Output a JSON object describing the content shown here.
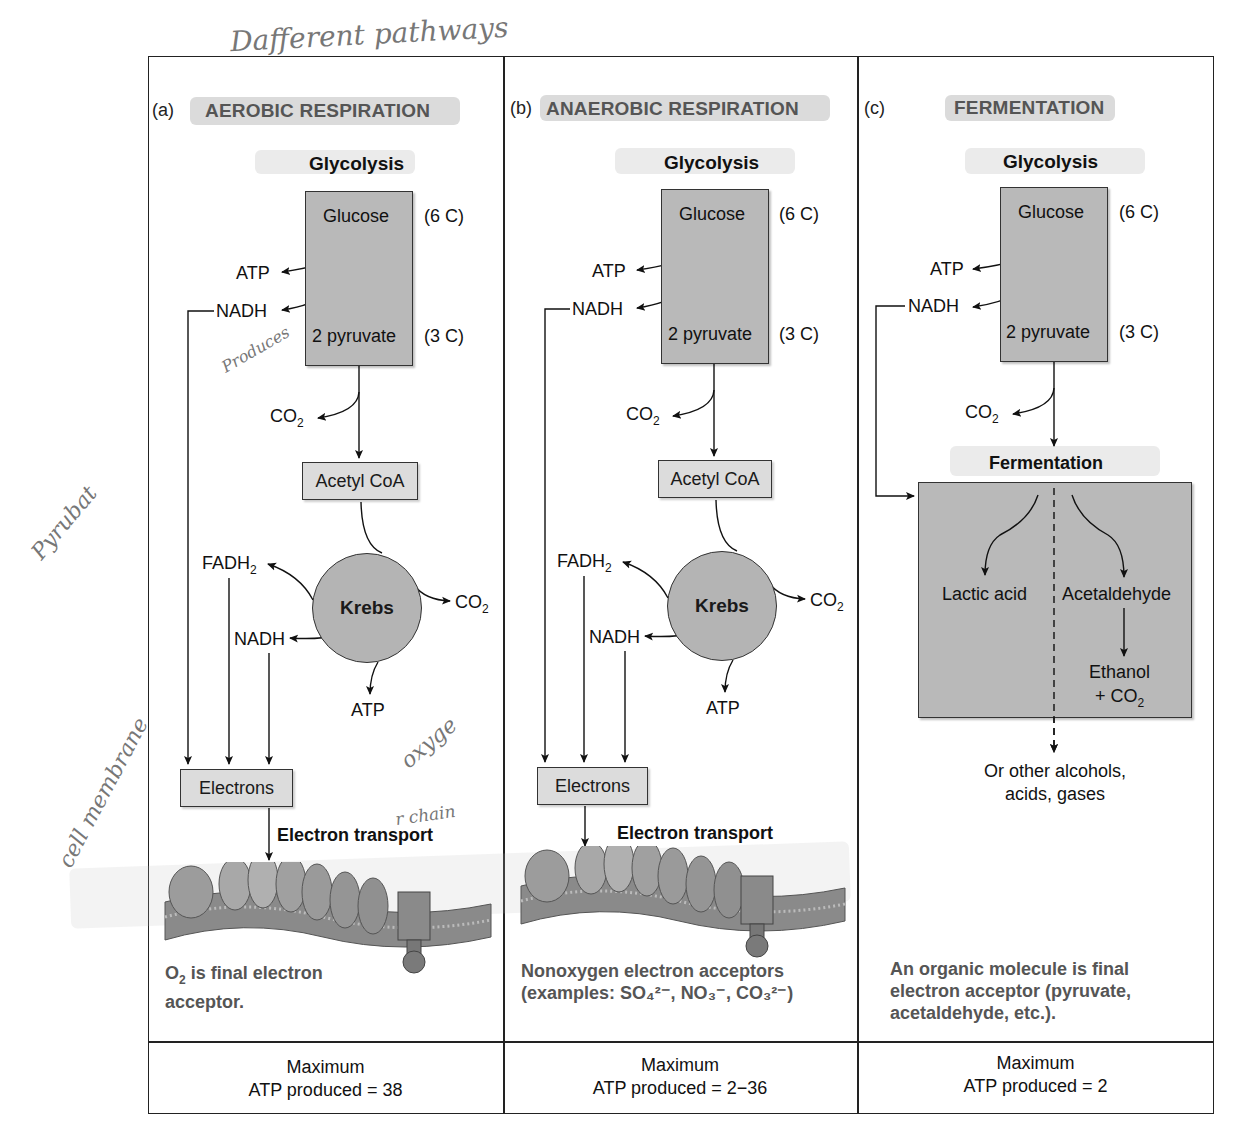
{
  "handwritten_notes": {
    "top": "Dafferent pathways",
    "produces": "Produces",
    "pyruvate": "Pyrubat",
    "cell_membrane": "cell membrane",
    "oxygen": "oxyge",
    "chain": "r chain"
  },
  "panels": [
    {
      "letter": "(a)",
      "title": "AEROBIC RESPIRATION",
      "glycolysis": "Glycolysis",
      "glucose": "Glucose",
      "glucose_carbons": "(6 C)",
      "atp": "ATP",
      "nadh": "NADH",
      "pyruvate": "2 pyruvate",
      "pyruvate_carbons": "(3 C)",
      "co2": "CO",
      "acetyl_coa": "Acetyl CoA",
      "fadh2": "FADH",
      "krebs": "Krebs",
      "krebs_co2": "CO",
      "krebs_nadh": "NADH",
      "krebs_atp": "ATP",
      "electrons": "Electrons",
      "electron_transport": "Electron transport",
      "acceptor_note_line1": "O",
      "acceptor_note_line1_rest": " is final electron",
      "acceptor_note_line2": "acceptor.",
      "atp_max_line1": "Maximum",
      "atp_max_line2": "ATP produced = 38"
    },
    {
      "letter": "(b)",
      "title": "ANAEROBIC RESPIRATION",
      "glycolysis": "Glycolysis",
      "glucose": "Glucose",
      "glucose_carbons": "(6 C)",
      "atp": "ATP",
      "nadh": "NADH",
      "pyruvate": "2 pyruvate",
      "pyruvate_carbons": "(3 C)",
      "co2": "CO",
      "acetyl_coa": "Acetyl CoA",
      "fadh2": "FADH",
      "krebs": "Krebs",
      "krebs_co2": "CO",
      "krebs_nadh": "NADH",
      "krebs_atp": "ATP",
      "electrons": "Electrons",
      "electron_transport": "Electron transport",
      "acceptor_note_line1": "Nonoxygen electron acceptors",
      "acceptor_note_line2": "(examples: SO₄²⁻, NO₃⁻, CO₃²⁻)",
      "atp_max_line1": "Maximum",
      "atp_max_line2": "ATP produced = 2−36"
    },
    {
      "letter": "(c)",
      "title": "FERMENTATION",
      "glycolysis": "Glycolysis",
      "glucose": "Glucose",
      "glucose_carbons": "(6 C)",
      "atp": "ATP",
      "nadh": "NADH",
      "pyruvate": "2 pyruvate",
      "pyruvate_carbons": "(3 C)",
      "co2": "CO",
      "fermentation": "Fermentation",
      "lactic_acid": "Lactic acid",
      "acetaldehyde": "Acetaldehyde",
      "ethanol": "Ethanol",
      "ethanol_co2": "+ CO",
      "other_line1": "Or other alcohols,",
      "other_line2": "acids, gases",
      "acceptor_note_line1": "An organic molecule is final",
      "acceptor_note_line2": "electron acceptor (pyruvate,",
      "acceptor_note_line3": "acetaldehyde, etc.).",
      "atp_max_line1": "Maximum",
      "atp_max_line2": "ATP produced = 2"
    }
  ],
  "subscripts": {
    "two": "2"
  }
}
